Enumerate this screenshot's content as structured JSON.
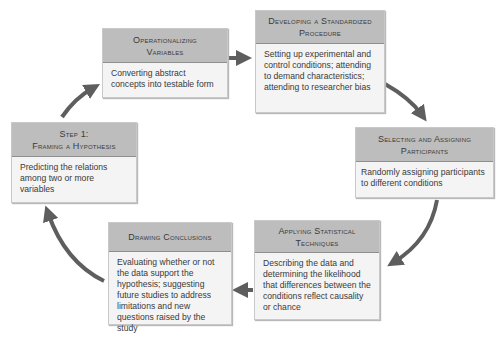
{
  "diagram": {
    "type": "cycle",
    "colors": {
      "header_bg": "#bdbdbd",
      "body_bg": "#f4f4f4",
      "arrow": "#5e5e5e",
      "text": "#3a3a3a"
    },
    "steps": [
      {
        "id": "framing",
        "title_lines": [
          "Step 1:",
          "Framing a Hypothesis"
        ],
        "description": "Predicting the relations among two or more variables"
      },
      {
        "id": "operationalizing",
        "title_lines": [
          "Operationalizing",
          "Variables"
        ],
        "description": "Converting abstract concepts into testable form"
      },
      {
        "id": "developing",
        "title_lines": [
          "Developing a Standardized",
          "Procedure"
        ],
        "description": "Setting up experimental and control conditions; attending to demand characteristics; attending to researcher bias"
      },
      {
        "id": "selecting",
        "title_lines": [
          "Selecting and Assigning",
          "Participants"
        ],
        "description": "Randomly assigning participants to different conditions"
      },
      {
        "id": "applying",
        "title_lines": [
          "Applying Statistical",
          "Techniques"
        ],
        "description": "Describing the data and determining the likelihood that differences between the conditions reflect causality or chance"
      },
      {
        "id": "drawing",
        "title_lines": [
          "Drawing Conclusions"
        ],
        "description": "Evaluating whether or not the data support the hypothesis; suggesting future studies to address limitations and new questions raised by the study"
      }
    ],
    "arrows": [
      {
        "from": "framing",
        "to": "operationalizing",
        "icon": "curved-arrow-icon"
      },
      {
        "from": "operationalizing",
        "to": "developing",
        "icon": "right-arrow-icon"
      },
      {
        "from": "developing",
        "to": "selecting",
        "icon": "curved-arrow-icon"
      },
      {
        "from": "selecting",
        "to": "applying",
        "icon": "curved-arrow-icon"
      },
      {
        "from": "applying",
        "to": "drawing",
        "icon": "left-arrow-icon"
      },
      {
        "from": "drawing",
        "to": "framing",
        "icon": "curved-arrow-icon"
      }
    ]
  }
}
